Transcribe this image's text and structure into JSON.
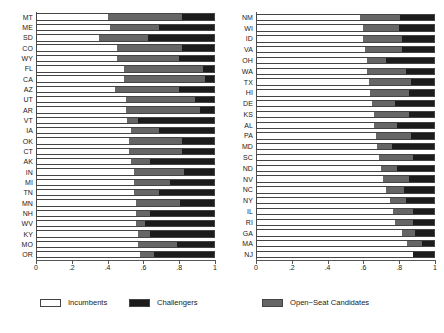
{
  "chart_data": {
    "type": "bar",
    "orientation": "horizontal",
    "stacked": true,
    "title": "",
    "subtitle": "",
    "xlabel": "",
    "ylabel": "",
    "xlim": [
      0,
      1
    ],
    "xticks": [
      0,
      0.2,
      0.4,
      0.6,
      0.8,
      1
    ],
    "xticklabels": [
      "0",
      ".2",
      ".4",
      ".6",
      ".8",
      "1"
    ],
    "grid": false,
    "legend_position": "bottom",
    "series": [
      {
        "name": "Incumbents",
        "color": "#ffffff"
      },
      {
        "name": "Open-Seat Candidates",
        "color": "#666666"
      },
      {
        "name": "Challengers",
        "color": "#1c1c1c"
      }
    ],
    "panels": [
      {
        "name": "left-panel",
        "categories": [
          "MT",
          "ME",
          "SD",
          "CO",
          "WY",
          "FL",
          "CA",
          "AZ",
          "UT",
          "AR",
          "VT",
          "IA",
          "OK",
          "CT",
          "AK",
          "IN",
          "MI",
          "TN",
          "MN",
          "NH",
          "WV",
          "KY",
          "MO",
          "OR"
        ],
        "values": {
          "Incumbents": [
            0.4,
            0.41,
            0.35,
            0.45,
            0.45,
            0.49,
            0.49,
            0.44,
            0.5,
            0.5,
            0.51,
            0.53,
            0.52,
            0.52,
            0.53,
            0.55,
            0.55,
            0.55,
            0.56,
            0.56,
            0.56,
            0.57,
            0.57,
            0.58
          ],
          "Open-Seat Candidates": [
            0.42,
            0.28,
            0.28,
            0.37,
            0.35,
            0.45,
            0.46,
            0.36,
            0.39,
            0.42,
            0.06,
            0.16,
            0.3,
            0.3,
            0.11,
            0.28,
            0.2,
            0.14,
            0.25,
            0.08,
            0.05,
            0.07,
            0.22,
            0.08
          ],
          "Challengers": [
            0.18,
            0.31,
            0.37,
            0.18,
            0.2,
            0.06,
            0.05,
            0.2,
            0.11,
            0.08,
            0.43,
            0.31,
            0.18,
            0.18,
            0.36,
            0.17,
            0.25,
            0.31,
            0.19,
            0.36,
            0.39,
            0.36,
            0.21,
            0.34
          ]
        }
      },
      {
        "name": "right-panel",
        "categories": [
          "NM",
          "WI",
          "ID",
          "VA",
          "OH",
          "WA",
          "TX",
          "HI",
          "DE",
          "KS",
          "AL",
          "PA",
          "MD",
          "SC",
          "ND",
          "NV",
          "NC",
          "NY",
          "IL",
          "RI",
          "GA",
          "MA",
          "NJ"
        ],
        "values": {
          "Incumbents": [
            0.58,
            0.6,
            0.6,
            0.61,
            0.62,
            0.62,
            0.63,
            0.64,
            0.65,
            0.66,
            0.66,
            0.67,
            0.68,
            0.69,
            0.7,
            0.71,
            0.73,
            0.75,
            0.77,
            0.78,
            0.82,
            0.85,
            0.88
          ],
          "Open-Seat Candidates": [
            0.23,
            0.2,
            0.22,
            0.21,
            0.11,
            0.22,
            0.24,
            0.22,
            0.13,
            0.2,
            0.13,
            0.2,
            0.08,
            0.19,
            0.09,
            0.15,
            0.1,
            0.09,
            0.11,
            0.1,
            0.07,
            0.08,
            0.0
          ],
          "Challengers": [
            0.19,
            0.2,
            0.18,
            0.18,
            0.27,
            0.16,
            0.13,
            0.14,
            0.22,
            0.14,
            0.21,
            0.13,
            0.24,
            0.12,
            0.21,
            0.14,
            0.17,
            0.16,
            0.12,
            0.12,
            0.11,
            0.07,
            0.12
          ]
        }
      }
    ]
  },
  "legend": {
    "incumbents": "Incumbents",
    "challengers": "Challengers",
    "open_seat": "Open−Seat Candidates"
  }
}
